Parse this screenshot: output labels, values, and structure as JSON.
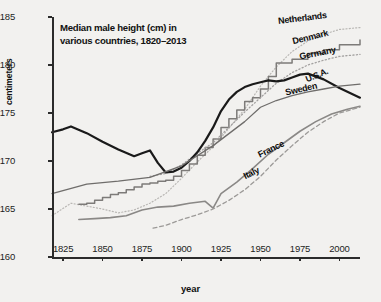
{
  "chart_data": {
    "type": "line",
    "title": "Median male height (cm) in\nvarious countries, 1820–2013",
    "xlabel": "year",
    "ylabel": "centimeters",
    "xlim": [
      1818,
      2013
    ],
    "ylim": [
      160,
      185
    ],
    "grid": false,
    "legend_position": "inline-right-end-labels",
    "xticks": [
      1825,
      1850,
      1875,
      1900,
      1925,
      1950,
      1975,
      2000
    ],
    "yticks": [
      160,
      165,
      170,
      175,
      180,
      185
    ],
    "xticklabels": [
      "1825",
      "1850",
      "1875",
      "1900",
      "1925",
      "1950",
      "1975",
      "2000"
    ],
    "yticklabels": [
      "160",
      "165",
      "170",
      "175",
      "180",
      "185"
    ],
    "series": [
      {
        "name": "Netherlands",
        "label": "Netherlands",
        "style": "dotted",
        "color": "#b9b7b4",
        "width": 1.2,
        "x": [
          1818,
          1830,
          1840,
          1850,
          1860,
          1870,
          1880,
          1890,
          1900,
          1910,
          1920,
          1930,
          1940,
          1950,
          1960,
          1970,
          1980,
          1990,
          2000,
          2013
        ],
        "y": [
          164.3,
          165.6,
          165.3,
          165.0,
          164.6,
          164.9,
          165.6,
          166.6,
          168.2,
          169.9,
          171.5,
          173.4,
          175.4,
          177.8,
          179.8,
          181.4,
          182.5,
          183.2,
          183.7,
          183.9
        ]
      },
      {
        "name": "Denmark",
        "label": "Denmark",
        "style": "stepped-solid",
        "color": "#7d7b79",
        "width": 1.5,
        "x": [
          1835,
          1840,
          1845,
          1850,
          1855,
          1860,
          1865,
          1870,
          1875,
          1880,
          1885,
          1890,
          1895,
          1900,
          1905,
          1910,
          1915,
          1920,
          1925,
          1930,
          1935,
          1940,
          1945,
          1950,
          1955,
          1960,
          1970,
          1980,
          1990,
          2000,
          2013
        ],
        "y": [
          165.5,
          165.6,
          165.9,
          166.2,
          166.5,
          166.7,
          167.0,
          167.3,
          167.6,
          167.7,
          167.9,
          168.0,
          168.4,
          169.0,
          169.7,
          170.6,
          171.4,
          172.3,
          173.5,
          174.4,
          175.3,
          176.2,
          176.6,
          177.5,
          178.8,
          180.2,
          180.6,
          181.2,
          181.6,
          182.1,
          182.6
        ]
      },
      {
        "name": "Germany",
        "label": "Germany",
        "style": "dotted",
        "color": "#a3a1a0",
        "width": 1.3,
        "x": [
          1880,
          1890,
          1900,
          1910,
          1920,
          1930,
          1940,
          1950,
          1960,
          1970,
          1980,
          1990,
          2000,
          2013
        ],
        "y": [
          168.4,
          168.7,
          169.6,
          170.8,
          171.9,
          173.5,
          175.1,
          176.6,
          178.1,
          179.2,
          180.0,
          180.5,
          180.9,
          181.1
        ]
      },
      {
        "name": "U.S.A.",
        "label": "U.S.A.",
        "style": "solid-thick",
        "color": "#1a1a1a",
        "width": 2.2,
        "x": [
          1818,
          1825,
          1830,
          1840,
          1850,
          1860,
          1870,
          1875,
          1880,
          1885,
          1890,
          1895,
          1900,
          1905,
          1910,
          1915,
          1920,
          1925,
          1930,
          1935,
          1940,
          1945,
          1950,
          1955,
          1960,
          1965,
          1970,
          1975,
          1980,
          1990,
          2000,
          2013
        ],
        "y": [
          173.0,
          173.3,
          173.6,
          172.9,
          172.0,
          171.2,
          170.5,
          170.8,
          171.1,
          169.8,
          168.8,
          168.9,
          169.3,
          170.0,
          170.9,
          172.1,
          173.5,
          175.2,
          176.4,
          177.2,
          177.7,
          178.0,
          178.2,
          178.4,
          178.3,
          178.4,
          178.7,
          179.0,
          179.1,
          178.5,
          177.6,
          176.6
        ]
      },
      {
        "name": "Sweden",
        "label": "Sweden",
        "style": "solid-thin",
        "color": "#6f6d6b",
        "width": 1.3,
        "x": [
          1818,
          1840,
          1860,
          1880,
          1900,
          1920,
          1940,
          1950,
          1960,
          1970,
          1980,
          1990,
          2000,
          2013
        ],
        "y": [
          166.6,
          167.6,
          167.9,
          168.3,
          169.5,
          171.6,
          174.1,
          175.6,
          176.3,
          176.8,
          177.2,
          177.5,
          177.8,
          178.0
        ]
      },
      {
        "name": "France",
        "label": "France",
        "style": "solid-medium",
        "color": "#8a8886",
        "width": 1.6,
        "x": [
          1835,
          1845,
          1855,
          1865,
          1875,
          1885,
          1895,
          1905,
          1915,
          1920,
          1925,
          1935,
          1945,
          1955,
          1965,
          1975,
          1985,
          1995,
          2005,
          2013
        ],
        "y": [
          163.9,
          164.0,
          164.1,
          164.3,
          164.9,
          165.2,
          165.3,
          165.6,
          165.8,
          165.1,
          166.6,
          167.8,
          169.2,
          170.7,
          171.9,
          173.1,
          174.1,
          174.9,
          175.4,
          175.7
        ]
      },
      {
        "name": "Italy",
        "label": "Italy",
        "style": "dashed",
        "color": "#9c9a98",
        "width": 1.3,
        "x": [
          1882,
          1890,
          1900,
          1910,
          1920,
          1930,
          1940,
          1950,
          1960,
          1970,
          1980,
          1990,
          2000,
          2013
        ],
        "y": [
          163.0,
          163.3,
          163.9,
          164.4,
          165.0,
          165.9,
          167.0,
          168.4,
          170.1,
          171.6,
          173.0,
          174.1,
          175.0,
          175.6
        ]
      }
    ]
  },
  "labels": {
    "netherlands": "Netherlands",
    "denmark": "Denmark",
    "germany": "Germany",
    "usa": "U.S.A.",
    "sweden": "Sweden",
    "france": "France",
    "italy": "Italy"
  },
  "colors": {
    "background": "#f2f1ef",
    "axis": "#2b2b2b",
    "text": "#111111"
  }
}
